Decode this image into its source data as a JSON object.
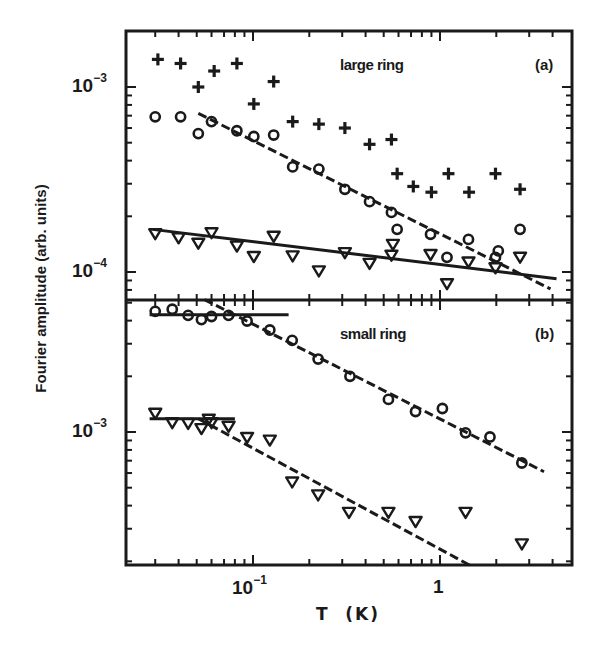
{
  "figure": {
    "ylabel": "Fourier amplitude (arb. units)",
    "xlabel": "T  (K)",
    "x_ticks": [
      {
        "base": "10",
        "exp": "−1",
        "value": 0.1
      },
      {
        "base": "1",
        "exp": "",
        "value": 1
      }
    ],
    "panels": [
      {
        "title": "large ring",
        "tag": "(a)",
        "y_ticks": [
          {
            "base": "10",
            "exp": "−3",
            "value": 0.001
          },
          {
            "base": "10",
            "exp": "−4",
            "value": 0.0001
          }
        ]
      },
      {
        "title": "small ring",
        "tag": "(b)",
        "y_ticks": [
          {
            "base": "10",
            "exp": "−3",
            "value": 0.001
          }
        ]
      }
    ]
  },
  "chart_data": [
    {
      "type": "scatter",
      "title": "large ring (a)",
      "xlabel": "T (K)",
      "ylabel": "Fourier amplitude (arb. units)",
      "xscale": "log",
      "yscale": "log",
      "xlim": [
        0.021,
        4.6
      ],
      "ylim": [
        7.1e-05,
        0.002
      ],
      "grid": false,
      "legend": "none (marker symbols: plus, circle, triangle-down)",
      "series": [
        {
          "name": "plus",
          "marker": "plus",
          "x": [
            0.031,
            0.041,
            0.051,
            0.062,
            0.082,
            0.101,
            0.129,
            0.163,
            0.225,
            0.31,
            0.42,
            0.55,
            0.59,
            0.72,
            0.9,
            1.11,
            1.43,
            1.98,
            2.68
          ],
          "y": [
            0.00141,
            0.00134,
            0.001,
            0.00122,
            0.00134,
            0.00081,
            0.00107,
            0.00065,
            0.00063,
            0.0006,
            0.00049,
            0.00052,
            0.00034,
            0.00029,
            0.00027,
            0.00034,
            0.00027,
            0.00034,
            0.00028
          ]
        },
        {
          "name": "circle",
          "marker": "circle",
          "x": [
            0.03,
            0.041,
            0.051,
            0.06,
            0.082,
            0.101,
            0.129,
            0.163,
            0.225,
            0.31,
            0.42,
            0.55,
            0.59,
            0.89,
            1.09,
            1.42,
            1.98,
            2.05,
            2.68
          ],
          "y": [
            0.00069,
            0.00069,
            0.00056,
            0.00065,
            0.00058,
            0.00054,
            0.00055,
            0.00037,
            0.00036,
            0.00028,
            0.00024,
            0.00021,
            0.00017,
            0.00016,
            0.00012,
            0.00015,
            0.00012,
            0.00013,
            0.00017
          ]
        },
        {
          "name": "triangle",
          "marker": "triangle-down",
          "x": [
            0.03,
            0.04,
            0.051,
            0.06,
            0.082,
            0.101,
            0.129,
            0.163,
            0.225,
            0.31,
            0.42,
            0.55,
            0.56,
            0.89,
            1.09,
            1.42,
            1.98,
            2.68
          ],
          "y": [
            0.000162,
            0.000154,
            0.000144,
            0.000164,
            0.000139,
            0.000122,
            0.000157,
            0.000123,
            0.000102,
            0.000128,
            0.000112,
            0.000124,
            0.000142,
            0.000125,
            8.7e-05,
            0.000114,
            0.000106,
            0.000121
          ]
        }
      ],
      "fits": [
        {
          "name": "solid fit (triangles)",
          "style": "solid",
          "x": [
            0.029,
            4.2
          ],
          "y": [
            0.00017,
            9.2e-05
          ]
        },
        {
          "name": "dashed fit (circles)",
          "style": "dashed",
          "x": [
            0.051,
            3.9
          ],
          "y": [
            0.00072,
            8.1e-05
          ]
        }
      ]
    },
    {
      "type": "scatter",
      "title": "small ring (b)",
      "xlabel": "T (K)",
      "ylabel": "Fourier amplitude (arb. units)",
      "xscale": "log",
      "yscale": "log",
      "xlim": [
        0.021,
        4.6
      ],
      "ylim": [
        0.00019,
        0.0052
      ],
      "grid": false,
      "legend": "none (marker symbols: circle, triangle-down)",
      "series": [
        {
          "name": "circle",
          "marker": "circle",
          "x": [
            0.03,
            0.037,
            0.045,
            0.053,
            0.06,
            0.074,
            0.093,
            0.123,
            0.162,
            0.223,
            0.33,
            0.53,
            0.74,
            1.03,
            1.37,
            1.85,
            2.74
          ],
          "y": [
            0.00449,
            0.00461,
            0.00427,
            0.00405,
            0.00421,
            0.00427,
            0.00398,
            0.00356,
            0.00313,
            0.00248,
            0.002,
            0.0015,
            0.00129,
            0.00134,
            0.00099,
            0.00094,
            0.00068
          ]
        },
        {
          "name": "triangle",
          "marker": "triangle-down",
          "x": [
            0.03,
            0.037,
            0.045,
            0.053,
            0.058,
            0.06,
            0.074,
            0.093,
            0.123,
            0.162,
            0.223,
            0.326,
            0.53,
            0.74,
            1.37,
            2.74
          ],
          "y": [
            0.00127,
            0.00113,
            0.00112,
            0.00105,
            0.00118,
            0.00113,
            0.00108,
            0.00094,
            0.00091,
            0.00054,
            0.00046,
            0.00037,
            0.00037,
            0.00033,
            0.00037,
            0.00025
          ]
        }
      ],
      "fits": [
        {
          "name": "solid plateau (circles)",
          "style": "solid",
          "x": [
            0.028,
            0.155
          ],
          "y": [
            0.0043,
            0.0043
          ]
        },
        {
          "name": "dashed fit (circles)",
          "style": "dashed",
          "x": [
            0.055,
            3.6
          ],
          "y": [
            0.0052,
            0.00061
          ]
        },
        {
          "name": "solid plateau (triangles)",
          "style": "solid",
          "x": [
            0.028,
            0.08
          ],
          "y": [
            0.00118,
            0.00118
          ]
        },
        {
          "name": "dashed fit (triangles)",
          "style": "dashed",
          "x": [
            0.051,
            1.45
          ],
          "y": [
            0.00118,
            0.00019
          ]
        }
      ]
    }
  ]
}
